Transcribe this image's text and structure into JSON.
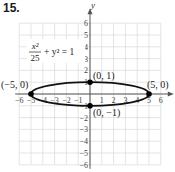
{
  "problem_number": "15.",
  "chart_data": {
    "type": "line",
    "title": "",
    "equation": "x²/25 + y² = 1",
    "equation_parts": {
      "num": "x²",
      "den": "25",
      "rest": "+ y² = 1"
    },
    "xlabel": "x",
    "ylabel": "y",
    "xlim": [
      -6,
      6
    ],
    "ylim": [
      -6,
      6
    ],
    "grid": true,
    "x_ticks": [
      "-6",
      "-5",
      "-4",
      "-3",
      "-2",
      "-1",
      "1",
      "2",
      "3",
      "4",
      "5",
      "6"
    ],
    "y_ticks": [
      "6",
      "5",
      "4",
      "3",
      "2",
      "1",
      "-1",
      "-2",
      "-3",
      "-4",
      "-5",
      "-6"
    ],
    "curve": {
      "kind": "ellipse",
      "center": [
        0,
        0
      ],
      "a": 5,
      "b": 1
    },
    "points": [
      {
        "x": -5,
        "y": 0,
        "label": "(−5, 0)"
      },
      {
        "x": 5,
        "y": 0,
        "label": "(5, 0)"
      },
      {
        "x": 0,
        "y": 1,
        "label": "(0, 1)"
      },
      {
        "x": 0,
        "y": -1,
        "label": "(0, −1)"
      }
    ]
  }
}
